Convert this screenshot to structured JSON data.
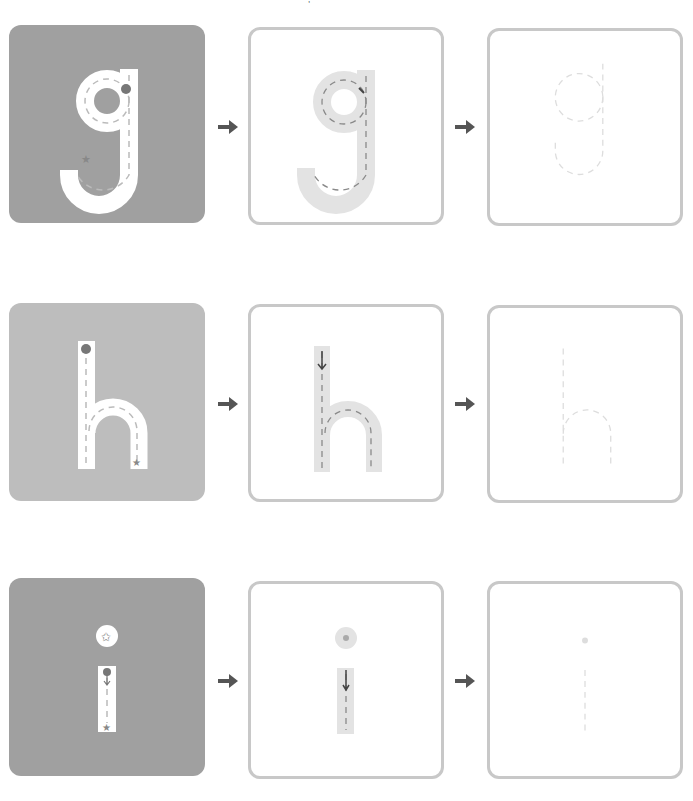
{
  "worksheet": {
    "rows": [
      {
        "letter": "g",
        "steps": [
          {
            "label": "Trace the model with finger",
            "style": "solid",
            "color": "#a0a0a0"
          },
          {
            "label": "Trace on shaded path",
            "style": "outline"
          },
          {
            "label": "Trace dotted letter",
            "style": "outline"
          }
        ]
      },
      {
        "letter": "h",
        "steps": [
          {
            "label": "Trace the model with finger",
            "style": "solid",
            "color": "#bdbdbd"
          },
          {
            "label": "Trace on shaded path",
            "style": "outline"
          },
          {
            "label": "Trace dotted letter",
            "style": "outline"
          }
        ]
      },
      {
        "letter": "i",
        "steps": [
          {
            "label": "Trace the model with finger",
            "style": "solid",
            "color": "#a0a0a0"
          },
          {
            "label": "Trace on shaded path",
            "style": "outline"
          },
          {
            "label": "Trace dotted letter",
            "style": "outline"
          }
        ]
      }
    ],
    "arrow_icon": "arrow-right-icon",
    "start_marker_icon": "dot-start-icon",
    "end_marker_icon": "star-end-icon",
    "colors": {
      "solid_dark": "#a0a0a0",
      "solid_light": "#bdbdbd",
      "card_border": "#c8c8c8",
      "path_fill": "#e3e3e3",
      "dash": "#8a8a8a",
      "arrow": "#555555"
    }
  }
}
